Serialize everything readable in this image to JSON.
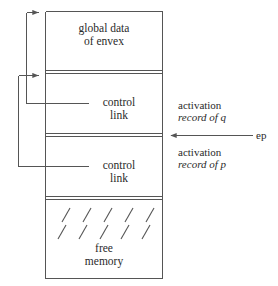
{
  "diagram": {
    "stroke_color": "#555555",
    "text_color": "#2a2a2a",
    "background_color": "#ffffff",
    "blocks": [
      {
        "id": "global-data",
        "line1": "global data",
        "line2": "of envex"
      },
      {
        "id": "control-link-q",
        "line1": "control",
        "line2": "link"
      },
      {
        "id": "control-link-p",
        "line1": "control",
        "line2": "link"
      },
      {
        "id": "free-memory",
        "line1": "free",
        "line2": "memory"
      }
    ],
    "annotations": {
      "activation_record_q_line1": "activation",
      "activation_record_q_line2": "record of q",
      "activation_record_p_line1": "activation",
      "activation_record_p_line2": "record of p",
      "ep_pointer": "ep"
    },
    "hatch_mark_count": 5
  }
}
